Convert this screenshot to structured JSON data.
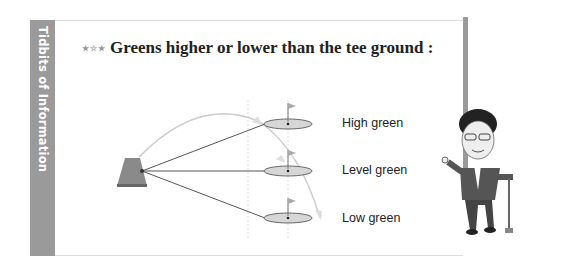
{
  "sidebar": {
    "label": "Tidbits of Information"
  },
  "header": {
    "stars": "★☆★",
    "title": "Greens higher or lower than the tee ground :"
  },
  "diagram": {
    "labels": [
      "High green",
      "Level green",
      "Low green"
    ],
    "colors": {
      "tee": "#8a8a8a",
      "green_fill": "#d6d6d6",
      "line": "#555555",
      "arc": "#cccccc",
      "sidebar": "#9a9a9a"
    }
  },
  "illustration": {
    "description": "caricature-golfer"
  }
}
